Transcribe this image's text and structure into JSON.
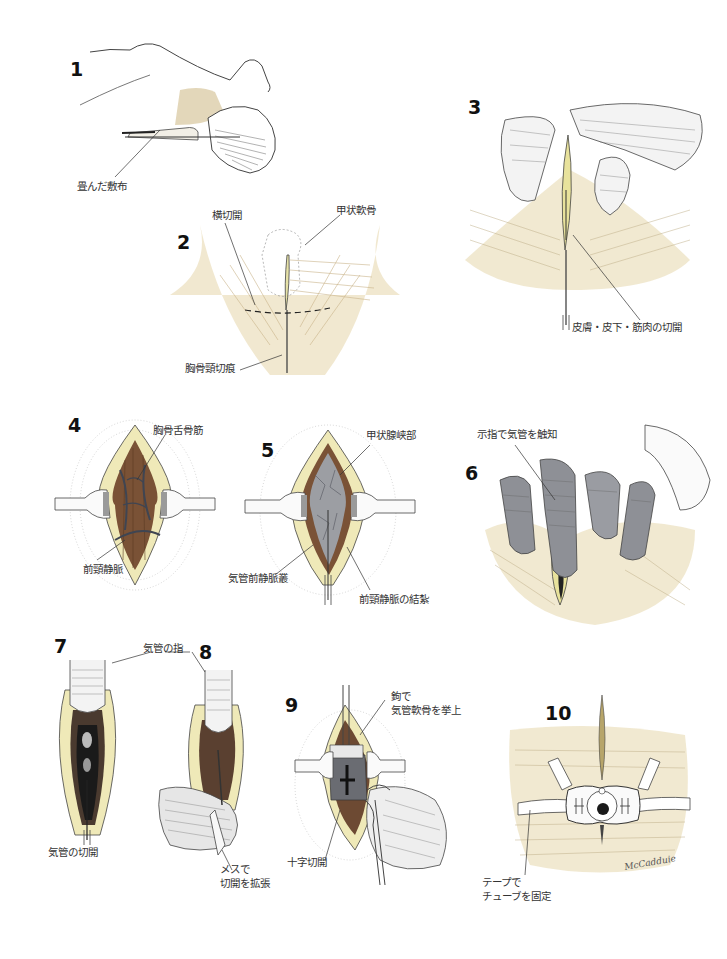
{
  "figure": {
    "colors": {
      "skin": "#e9dcc0",
      "skin_shade": "#c9b48a",
      "fat": "#efe9b8",
      "muscle": "#7a5236",
      "vein": "#4a4f5c",
      "trachea": "#8d8f94",
      "ink": "#333333"
    },
    "panels": [
      {
        "number": "1",
        "labels": [
          "畳んだ敷布"
        ]
      },
      {
        "number": "2",
        "labels": [
          "横切開",
          "甲状軟骨",
          "胸骨頸切痕"
        ]
      },
      {
        "number": "3",
        "labels": [
          "皮膚・皮下・筋肉の切開"
        ]
      },
      {
        "number": "4",
        "labels": [
          "胸骨舌骨筋",
          "前頸静脈"
        ]
      },
      {
        "number": "5",
        "labels": [
          "甲状腺峡部",
          "気管前静脈叢",
          "前頸静脈の結紮"
        ]
      },
      {
        "number": "6",
        "labels": [
          "示指で気管を触知"
        ]
      },
      {
        "number": "7",
        "labels": [
          "気管の切開"
        ]
      },
      {
        "number": "8",
        "labels": [
          "気管の指",
          "メスで",
          "切開を拡張"
        ]
      },
      {
        "number": "9",
        "labels": [
          "鉤で",
          "気管軟骨を挙上",
          "十字切開"
        ]
      },
      {
        "number": "10",
        "labels": [
          "テープで",
          "チューブを固定"
        ]
      }
    ],
    "signature": "McCadduie"
  }
}
